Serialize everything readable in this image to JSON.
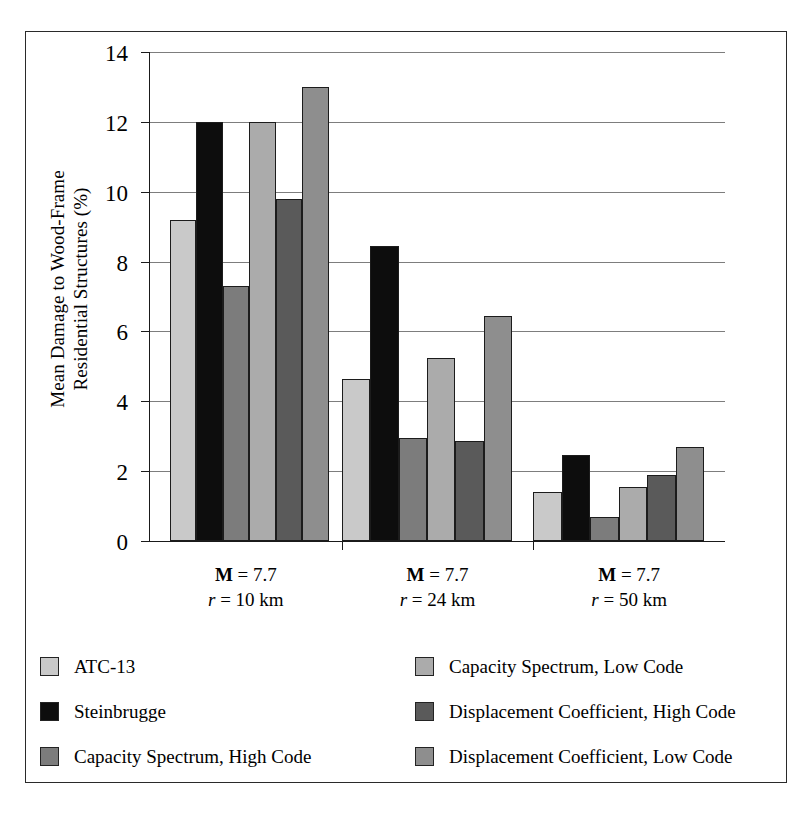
{
  "chart_data": {
    "type": "bar",
    "title": "",
    "xlabel": "",
    "ylabel": "Mean Damage to Wood-Frame Residential Structures (%)",
    "ylabel_lines": [
      "Mean Damage to Wood-Frame",
      "Residential Structures (%)"
    ],
    "ylim": [
      0,
      14
    ],
    "ytick_values": [
      0,
      2,
      4,
      6,
      8,
      10,
      12,
      14
    ],
    "ytick_labels": [
      "0",
      "2",
      "4",
      "6",
      "8",
      "10",
      "12",
      "14"
    ],
    "grid": true,
    "legend_position": "bottom",
    "categories": [
      {
        "line1_prefix": "M",
        "line1_rest": " = 7.7",
        "line2_prefix": "r",
        "line2_rest": " = 10 km"
      },
      {
        "line1_prefix": "M",
        "line1_rest": " = 7.7",
        "line2_prefix": "r",
        "line2_rest": " = 24 km"
      },
      {
        "line1_prefix": "M",
        "line1_rest": " = 7.7",
        "line2_prefix": "r",
        "line2_rest": " = 50 km"
      }
    ],
    "series": [
      {
        "name": "ATC-13",
        "color": "#c9c9c9",
        "values": [
          9.2,
          4.65,
          1.4
        ]
      },
      {
        "name": "Steinbrugge",
        "color": "#0d0d0d",
        "values": [
          12.0,
          8.45,
          2.45
        ]
      },
      {
        "name": "Capacity Spectrum, High Code",
        "color": "#7c7c7c",
        "values": [
          7.3,
          2.95,
          0.7
        ]
      },
      {
        "name": "Capacity Spectrum, Low Code",
        "color": "#ababab",
        "values": [
          12.0,
          5.25,
          1.55
        ]
      },
      {
        "name": "Displacement Coefficient, High Code",
        "color": "#5a5a5a",
        "values": [
          9.8,
          2.85,
          1.9
        ]
      },
      {
        "name": "Displacement Coefficient, Low Code",
        "color": "#8e8e8e",
        "values": [
          13.0,
          6.45,
          2.7
        ]
      }
    ],
    "legend_entries": [
      {
        "name": "ATC-13",
        "color": "#c9c9c9"
      },
      {
        "name": "Capacity Spectrum, Low Code",
        "color": "#ababab"
      },
      {
        "name": "Steinbrugge",
        "color": "#0d0d0d"
      },
      {
        "name": "Displacement Coefficient, High Code",
        "color": "#5a5a5a"
      },
      {
        "name": "Capacity Spectrum, High Code",
        "color": "#7c7c7c"
      },
      {
        "name": "Displacement Coefficient, Low Code",
        "color": "#8e8e8e"
      }
    ]
  }
}
